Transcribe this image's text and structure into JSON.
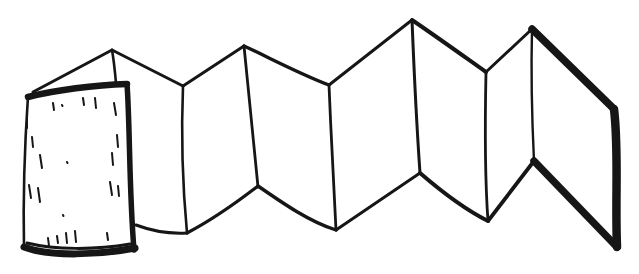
{
  "meta": {
    "background_color": "#ffffff",
    "ink_color": "#161616"
  },
  "drawing": {
    "viewbox": "0 0 639 274",
    "description": "Black line illustration: textured front cover at left, six zigzag folded panels in the middle, thick-edged back cover panel at right",
    "elements": [
      {
        "name": "front-cover-top-edge",
        "d": "M28,97 C55,90 95,85 127,84",
        "width": 6.5
      },
      {
        "name": "front-cover-right-edge",
        "d": "M127,84 C130,125 129,190 134,250",
        "width": 5.5
      },
      {
        "name": "front-cover-bottom-edge",
        "d": "M135,248 C100,255 50,257 24,247",
        "width": 7
      },
      {
        "name": "front-cover-bottom-inner-line",
        "d": "M27,243 C55,250 95,250 130,244",
        "width": 3
      },
      {
        "name": "front-cover-left-edge",
        "d": "M28,96 C25,140 23,200 24,248",
        "width": 2.6
      },
      {
        "name": "front-cover-texture-hatches",
        "d": "M53,103 L54,110 M62,105 L62.5,106 M83,98 L84,105 M95,98 L96,108 M114,103 L116,115 M117,135 L118,147 M112,153 L113,165 M110,182 L112,195 M118,186 L119,196 M27,118 L27,128 M32,137 L33,147 M40,155 L42,168 M29,185 L31,198 M38,188 L40,202 M67,162 L67.5,163 M63,215 L63.5,216 M48,238 L49,246 M57,236 L58,243 M66,233 L67,243 M75,231 L76,242 M107,233 L108,240",
        "width": 2
      },
      {
        "name": "first-panel-top-edge",
        "d": "M33,92 L112,50",
        "width": 3
      },
      {
        "name": "first-panel-fold-tip",
        "d": "M112,50 C114,61 115,72 116,83",
        "width": 2.6
      },
      {
        "name": "top-edge-peak1-valley1",
        "d": "M112,50 L183,86",
        "width": 3
      },
      {
        "name": "top-edge-valley1-peak2",
        "d": "M183,86 L244,46",
        "width": 3
      },
      {
        "name": "top-edge-peak2-valley2",
        "d": "M244,46 C272,59 300,74 329,85",
        "width": 3.4
      },
      {
        "name": "top-edge-valley2-peak3",
        "d": "M329,85 L412,20",
        "width": 3
      },
      {
        "name": "top-edge-peak3-valley3",
        "d": "M412,20 C437,37 462,55 486,72",
        "width": 4
      },
      {
        "name": "top-edge-valley3-peak4",
        "d": "M486,72 L532,29",
        "width": 3
      },
      {
        "name": "fold-line-1",
        "d": "M183,86 C181,135 183,190 187,233",
        "width": 2.6
      },
      {
        "name": "fold-line-2",
        "d": "M244,46 C249,95 254,150 258,187",
        "width": 2.8
      },
      {
        "name": "fold-line-3",
        "d": "M329,85 C331,135 334,190 336,230",
        "width": 2.8
      },
      {
        "name": "fold-line-4",
        "d": "M412,20 C414,70 417,130 420,173",
        "width": 3
      },
      {
        "name": "fold-line-5",
        "d": "M486,72 C485,120 485,180 488,221",
        "width": 2.8
      },
      {
        "name": "back-cover-spine-fold",
        "d": "M532,29 C531,70 532,120 534,161",
        "width": 2.4
      },
      {
        "name": "first-panel-bottom-edge",
        "d": "M136,225 C152,231 170,234 187,233",
        "width": 3
      },
      {
        "name": "bottom-edge-valley1-peak2",
        "d": "M187,233 C210,221 236,203 258,186",
        "width": 3.2
      },
      {
        "name": "bottom-edge-peak2-valley2",
        "d": "M258,186 C284,204 310,222 336,230",
        "width": 3.4
      },
      {
        "name": "bottom-edge-valley2-peak3",
        "d": "M336,230 L420,173",
        "width": 3
      },
      {
        "name": "bottom-edge-peak3-valley3",
        "d": "M420,173 C442,192 464,209 488,221",
        "width": 4
      },
      {
        "name": "bottom-edge-valley3-peak4",
        "d": "M488,221 L534,161",
        "width": 3.8
      },
      {
        "name": "back-cover-top-edge",
        "d": "M532,29 L614,109",
        "width": 7.5
      },
      {
        "name": "back-cover-right-edge",
        "d": "M614,109 C619,150 615,200 617,247",
        "width": 8.5
      },
      {
        "name": "back-cover-bottom-edge",
        "d": "M617,247 L534,161",
        "width": 7.5
      }
    ]
  }
}
